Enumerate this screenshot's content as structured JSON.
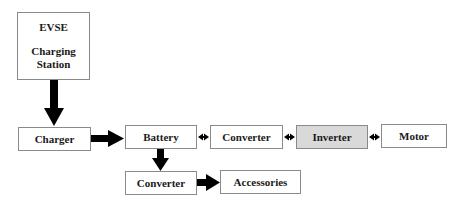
{
  "diagram": {
    "nodes": {
      "evse": {
        "line1": "EVSE",
        "line2": "Charging",
        "line3": "Station"
      },
      "charger": {
        "label": "Charger"
      },
      "battery": {
        "label": "Battery"
      },
      "converter_main": {
        "label": "Converter"
      },
      "inverter": {
        "label": "Inverter",
        "fill": "#d9d9d9"
      },
      "motor": {
        "label": "Motor"
      },
      "converter_aux": {
        "label": "Converter"
      },
      "accessories": {
        "label": "Accessories"
      }
    },
    "edges": [
      {
        "from": "EVSE Charging Station",
        "to": "Charger",
        "type": "one-way"
      },
      {
        "from": "Charger",
        "to": "Battery",
        "type": "one-way"
      },
      {
        "from": "Battery",
        "to": "Converter",
        "type": "two-way"
      },
      {
        "from": "Converter",
        "to": "Inverter",
        "type": "two-way"
      },
      {
        "from": "Inverter",
        "to": "Motor",
        "type": "two-way"
      },
      {
        "from": "Battery",
        "to": "Converter (aux)",
        "type": "one-way"
      },
      {
        "from": "Converter (aux)",
        "to": "Accessories",
        "type": "one-way"
      }
    ],
    "colors": {
      "border": "#8a8a8a",
      "arrow": "#000000",
      "shaded": "#d9d9d9"
    }
  }
}
